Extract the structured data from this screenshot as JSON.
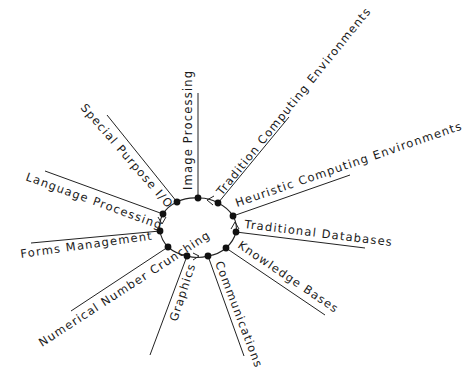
{
  "diagram": {
    "type": "radial-hub",
    "hub": {
      "cx": 199,
      "cy": 228,
      "r": 31
    },
    "spokes": [
      {
        "id": "image-processing",
        "label": "Image Processing",
        "node": [
          198,
          198
        ],
        "end": [
          198,
          93
        ],
        "text": {
          "x": 192,
          "y": 190,
          "angle": -90
        }
      },
      {
        "id": "tradition-computing",
        "label": "Tradition Computing Environments",
        "node": [
          218,
          203
        ],
        "end": [
          289,
          117
        ],
        "text": {
          "x": 222,
          "y": 196,
          "angle": -51
        }
      },
      {
        "id": "heuristic-computing",
        "label": "Heuristic Computing Environments",
        "node": [
          233,
          216
        ],
        "end": [
          350,
          175
        ],
        "text": {
          "x": 237,
          "y": 207,
          "angle": -19
        }
      },
      {
        "id": "traditional-databases",
        "label": "Traditional Databases",
        "node": [
          236,
          232
        ],
        "end": [
          365,
          248
        ],
        "text": {
          "x": 244,
          "y": 228,
          "angle": 7
        }
      },
      {
        "id": "knowledge-bases",
        "label": "Knowledge Bases",
        "node": [
          226,
          248
        ],
        "end": [
          325,
          315
        ],
        "text": {
          "x": 237,
          "y": 247,
          "angle": 34
        }
      },
      {
        "id": "communications",
        "label": "Communications",
        "node": [
          208,
          256
        ],
        "end": [
          244,
          356
        ],
        "text": {
          "x": 215,
          "y": 263,
          "angle": 69
        }
      },
      {
        "id": "graphics",
        "label": "Graphics",
        "node": [
          187,
          256
        ],
        "end": [
          150,
          355
        ],
        "text": {
          "x": 177,
          "y": 322,
          "angle": -72
        }
      },
      {
        "id": "numerical-number-crunching",
        "label": "Numerical Number Crunching",
        "node": [
          168,
          247
        ],
        "end": [
          71,
          311
        ],
        "text": {
          "x": 42,
          "y": 347,
          "angle": -33
        }
      },
      {
        "id": "forms-management",
        "label": "Forms Management",
        "node": [
          160,
          231
        ],
        "end": [
          31,
          243
        ],
        "text": {
          "x": 21,
          "y": 258,
          "angle": -8
        }
      },
      {
        "id": "language-processing",
        "label": "Language Processing",
        "node": [
          163,
          214
        ],
        "end": [
          45,
          171
        ],
        "text": {
          "x": 25,
          "y": 180,
          "angle": 20
        }
      },
      {
        "id": "special-purpose-io",
        "label": "Special Purpose I/O",
        "node": [
          177,
          202
        ],
        "end": [
          107,
          115
        ],
        "text": {
          "x": 80,
          "y": 108,
          "angle": 49
        }
      }
    ],
    "arrows": [
      {
        "at": [
          208,
          200
        ],
        "points": [
          [
            214,
            196
          ],
          [
            207,
            200
          ],
          [
            213,
            205
          ]
        ]
      },
      {
        "at": [
          235,
          224
        ],
        "points": [
          [
            231,
            229
          ],
          [
            235,
            222
          ],
          [
            239,
            229
          ]
        ]
      },
      {
        "at": [
          162,
          222
        ],
        "points": [
          [
            158,
            217
          ],
          [
            162,
            224
          ],
          [
            166,
            217
          ]
        ]
      },
      {
        "at": [
          197,
          257
        ],
        "points": [
          [
            193,
            253
          ],
          [
            199,
            256
          ],
          [
            193,
            260
          ]
        ]
      }
    ]
  }
}
